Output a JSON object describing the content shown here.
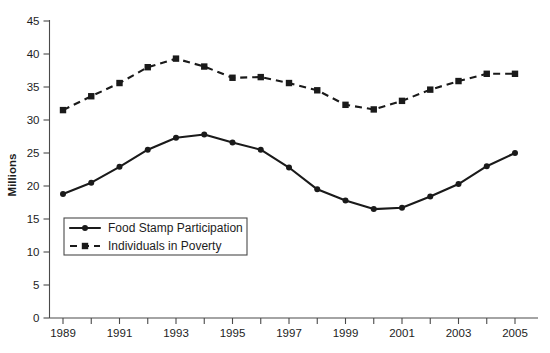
{
  "chart_data": {
    "type": "line",
    "title": "",
    "xlabel": "",
    "ylabel": "Millions",
    "x": [
      1989,
      1990,
      1991,
      1992,
      1993,
      1994,
      1995,
      1996,
      1997,
      1998,
      1999,
      2000,
      2001,
      2002,
      2003,
      2004,
      2005
    ],
    "xlim": [
      1989,
      2005
    ],
    "ylim": [
      0,
      45
    ],
    "ytick_labels": [
      "0",
      "5",
      "10",
      "15",
      "20",
      "25",
      "30",
      "35",
      "40",
      "45"
    ],
    "yticks": [
      0,
      5,
      10,
      15,
      20,
      25,
      30,
      35,
      40,
      45
    ],
    "xtick_labels": [
      "1989",
      "1991",
      "1993",
      "1995",
      "1997",
      "1999",
      "2001",
      "2003",
      "2005"
    ],
    "xticks_labeled": [
      1989,
      1991,
      1993,
      1995,
      1997,
      1999,
      2001,
      2003,
      2005
    ],
    "grid": false,
    "legend_position": "lower-left-inside",
    "series": [
      {
        "name": "Food Stamp Participation",
        "style": "solid",
        "marker": "circle",
        "color": "#1a1a1a",
        "values": [
          18.8,
          20.5,
          22.9,
          25.5,
          27.3,
          27.8,
          26.6,
          25.5,
          22.8,
          19.5,
          17.8,
          16.5,
          16.7,
          18.4,
          20.3,
          23.0,
          25.0
        ]
      },
      {
        "name": "Individuals in Poverty",
        "style": "dashed",
        "marker": "square",
        "color": "#1a1a1a",
        "values": [
          31.5,
          33.6,
          35.6,
          38.0,
          39.3,
          38.1,
          36.4,
          36.5,
          35.6,
          34.5,
          32.3,
          31.6,
          32.9,
          34.6,
          35.9,
          37.0,
          37.0
        ]
      }
    ]
  },
  "caption": {
    "text": ""
  }
}
